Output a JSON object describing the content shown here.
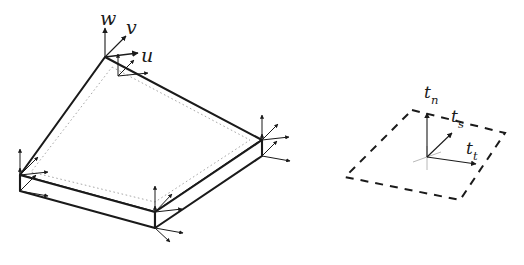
{
  "figure": {
    "background_color": "#ffffff",
    "ink_color": "#1a1a1a",
    "faint_ink_color": "#9a9a9a",
    "width": 524,
    "height": 265
  },
  "left_diagram": {
    "name": "plate-element-with-nodal-dof",
    "description": "Shaded quadrilateral plate element drawn in oblique projection with finite thickness; each of the four corner nodes carries a triad of displacement arrows.",
    "line_style": "solid",
    "top_face": {
      "corners": [
        {
          "id": "top",
          "x": 105,
          "y": 57
        },
        {
          "id": "right",
          "x": 262,
          "y": 140
        },
        {
          "id": "bottom",
          "x": 155,
          "y": 212
        },
        {
          "id": "left",
          "x": 20,
          "y": 175
        }
      ]
    },
    "bottom_face": {
      "thickness_px": 16,
      "corners": [
        {
          "id": "right",
          "x": 262,
          "y": 156
        },
        {
          "id": "bottom",
          "x": 155,
          "y": 228
        },
        {
          "id": "left",
          "x": 20,
          "y": 191
        }
      ]
    },
    "inner_dotted_outline": {
      "style": "dotted",
      "corners": [
        {
          "x": 112,
          "y": 67
        },
        {
          "x": 250,
          "y": 140
        },
        {
          "x": 155,
          "y": 202
        },
        {
          "x": 31,
          "y": 172
        }
      ]
    },
    "nodal_triads": [
      {
        "node": "top",
        "x": 105,
        "y": 57,
        "labelled": true
      },
      {
        "node": "top_inner",
        "x": 118,
        "y": 74,
        "labelled": false
      },
      {
        "node": "right",
        "x": 262,
        "y": 140,
        "labelled": false
      },
      {
        "node": "right_lower",
        "x": 262,
        "y": 156,
        "labelled": false
      },
      {
        "node": "bottom",
        "x": 155,
        "y": 212,
        "labelled": false
      },
      {
        "node": "bottom_lower",
        "x": 155,
        "y": 228,
        "labelled": false
      },
      {
        "node": "left",
        "x": 20,
        "y": 175,
        "labelled": false
      },
      {
        "node": "left_lower",
        "x": 20,
        "y": 191,
        "labelled": false
      }
    ],
    "labels": {
      "w": "w",
      "v": "v",
      "u": "u"
    },
    "axis_meaning": {
      "w": "out-of-plane (vertical) displacement",
      "v": "in-plane displacement along second axis",
      "u": "in-plane displacement along first axis"
    }
  },
  "right_diagram": {
    "name": "reference-element-with-traction-triad",
    "description": "Dashed quadrilateral reference element in oblique projection with a local traction coordinate triad at its centre.",
    "line_style": "dashed",
    "outline": {
      "corners": [
        {
          "id": "top",
          "x": 412,
          "y": 110
        },
        {
          "id": "right",
          "x": 505,
          "y": 133
        },
        {
          "id": "bottom",
          "x": 460,
          "y": 200
        },
        {
          "id": "left",
          "x": 345,
          "y": 177
        }
      ]
    },
    "triad": {
      "origin": {
        "x": 427,
        "y": 157
      },
      "axes": [
        {
          "id": "t_n",
          "label_base": "t",
          "label_sub": "n",
          "tip_x": 427,
          "tip_y": 113
        },
        {
          "id": "t_s",
          "label_base": "t",
          "label_sub": "s",
          "tip_x": 452,
          "tip_y": 133
        },
        {
          "id": "t_t",
          "label_base": "t",
          "label_sub": "t",
          "tip_x": 475,
          "tip_y": 163
        }
      ]
    },
    "labels": {
      "t_n_base": "t",
      "t_n_sub": "n",
      "t_s_base": "t",
      "t_s_sub": "s",
      "t_t_base": "t",
      "t_t_sub": "t"
    },
    "axis_meaning": {
      "t_n": "normal traction direction",
      "t_s": "first tangential traction direction",
      "t_t": "second tangential traction direction"
    }
  }
}
